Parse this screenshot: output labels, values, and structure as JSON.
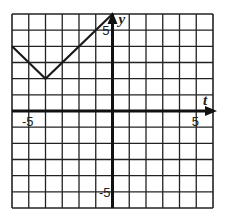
{
  "chart_data": {
    "type": "line",
    "title": "",
    "xlabel": "t",
    "ylabel": "y",
    "xlim": [
      -6,
      6
    ],
    "ylim": [
      -6,
      6
    ],
    "grid": true,
    "grid_step": 1,
    "tick_labels": {
      "x": [
        {
          "value": -5,
          "label": "-5"
        },
        {
          "value": 5,
          "label": "5"
        }
      ],
      "y": [
        {
          "value": 5,
          "label": "5"
        },
        {
          "value": -5,
          "label": "-5"
        }
      ]
    },
    "series": [
      {
        "name": "y = |t + 4| + 2",
        "x": [
          -6,
          -4,
          0
        ],
        "y": [
          4,
          2,
          6
        ]
      }
    ],
    "legend": null
  },
  "labels": {
    "x_axis": "t",
    "y_axis": "y",
    "x_neg": "-5",
    "x_pos": "5",
    "y_pos": "5",
    "y_neg": "-5"
  },
  "colors": {
    "grid": "#222222",
    "axis": "#111111",
    "line": "#1a1a1a",
    "background": "#ffffff"
  }
}
